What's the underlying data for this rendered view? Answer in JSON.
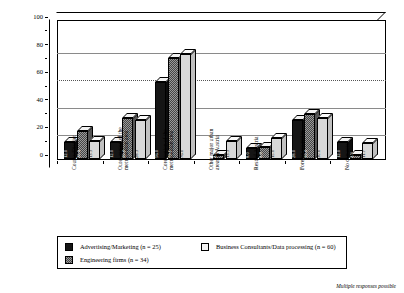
{
  "chart_data": {
    "type": "bar",
    "title": "",
    "xlabel": "",
    "ylabel": "Percent of producer service firms",
    "ylim": [
      0,
      100
    ],
    "yticks": [
      0,
      20,
      40,
      60,
      80,
      100
    ],
    "grid": true,
    "legend_position": "bottom",
    "categories": [
      "County/District",
      "Outer region of the metropolitan area",
      "Core region of the metropolitan area",
      "Other major urban areas in Austria",
      "Rest of Austria",
      "Foreign countries",
      "No contacts"
    ],
    "category_lines": [
      [
        "County/District"
      ],
      [
        "Outer region of the",
        "metropolitan area"
      ],
      [
        "Core region of the",
        "metropolitan area"
      ],
      [
        "Other major urban",
        "areas in Austria"
      ],
      [
        "Rest of Austria"
      ],
      [
        "Foreign countries"
      ],
      [
        "No contacts"
      ]
    ],
    "series": [
      {
        "name": "Advertising/Marketing (n = 25)",
        "values": [
          12.0,
          12.0,
          56.0,
          0.0,
          8.0,
          28.0,
          12.0
        ]
      },
      {
        "name": "Engineering firms (n = 34)",
        "values": [
          20.6,
          29.4,
          73.5,
          2.9,
          8.8,
          32.4,
          2.9
        ]
      },
      {
        "name": "Business Consultants/Data processing (n = 60)",
        "values": [
          13.3,
          28.3,
          76.0,
          13.3,
          15.0,
          30.0,
          11.7
        ]
      }
    ],
    "value_labels": [
      [
        "12.0",
        "20.6",
        "13.3"
      ],
      [
        "12.0",
        "29.4",
        "28.3"
      ],
      [
        "56.0",
        "73.5",
        "76.0"
      ],
      [
        "",
        "2.9",
        "13.3"
      ],
      [
        "8.0",
        "8.8",
        "15.0"
      ],
      [
        "28.0",
        "32.4",
        "30.0"
      ],
      [
        "12.0",
        "2.9",
        "11.7"
      ]
    ],
    "footnote": "Multiple responses possible"
  },
  "legend": {
    "items": [
      {
        "label": "Advertising/Marketing (n = 25)",
        "swatch": "k0"
      },
      {
        "label": "Engineering firms (n = 34)",
        "swatch": "k1"
      },
      {
        "label": "Business Consultants/Data processing (n = 60)",
        "swatch": "k2"
      }
    ]
  },
  "axis": {
    "y_title": "Percent of producer service firms",
    "y_tick_0": "0",
    "y_tick_1": "20",
    "y_tick_2": "40",
    "y_tick_3": "60",
    "y_tick_4": "80",
    "y_tick_5": "100"
  },
  "footnote": "Multiple responses possible"
}
